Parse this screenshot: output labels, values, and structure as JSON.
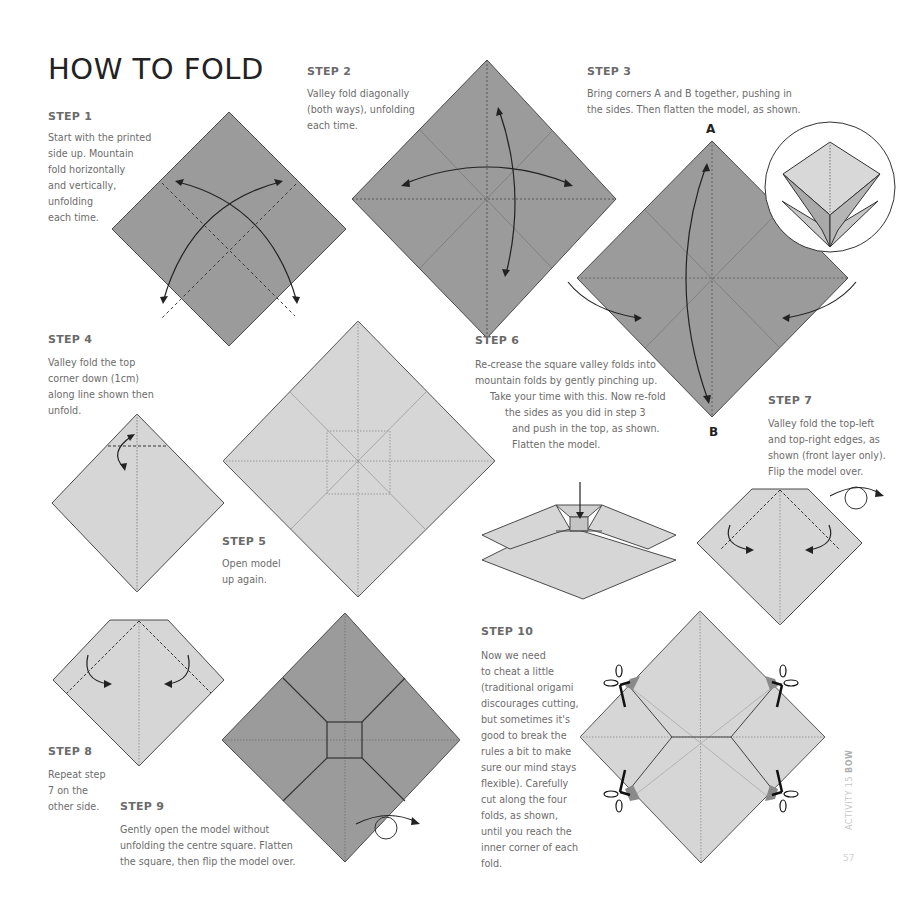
{
  "page": {
    "title": "HOW TO FOLD",
    "side_label": {
      "prefix": "ACTIVITY 15 ",
      "name": "BOW"
    },
    "page_number": "57"
  },
  "colors": {
    "dark_paper": "#9b9b9b",
    "light_paper": "#d6d6d6",
    "outline": "#4a4a4a",
    "text": "#6c6c6c",
    "heading": "#222222"
  },
  "steps": [
    {
      "heading": "STEP 1",
      "text": "Start with the printed\nside up. Mountain\nfold horizontally\nand vertically,\nunfolding\neach time."
    },
    {
      "heading": "STEP 2",
      "text": "Valley fold diagonally\n(both ways), unfolding\neach time."
    },
    {
      "heading": "STEP 3",
      "text": "Bring corners A and B together, pushing in\nthe sides. Then flatten the model, as shown."
    },
    {
      "heading": "STEP 4",
      "text": "Valley fold the top\ncorner down (1cm)\nalong line shown then\nunfold."
    },
    {
      "heading": "STEP 5",
      "text": "Open model\nup again."
    },
    {
      "heading": "STEP 6",
      "lines": [
        "Re-crease the square valley folds into",
        "mountain folds by gently pinching up.",
        "Take your time with this. Now re-fold",
        "the sides as you did in step 3",
        "and push in the top, as shown.",
        "Flatten the model."
      ]
    },
    {
      "heading": "STEP 7",
      "text": "Valley fold the top-left\nand top-right edges, as\nshown (front layer only).\nFlip the model over."
    },
    {
      "heading": "STEP 8",
      "text": "Repeat step\n7 on the\nother side."
    },
    {
      "heading": "STEP 9",
      "text": "Gently open the model without\nunfolding the centre square. Flatten\nthe square, then flip the model over."
    },
    {
      "heading": "STEP 10",
      "text": "Now we need\nto cheat a little\n(traditional origami\ndiscourages cutting,\nbut sometimes it's\ngood to break the\nrules a bit to make\nsure our mind stays\nflexible). Carefully\ncut along the four\nfolds, as shown,\nuntil you reach the\ninner corner of each\nfold."
    }
  ],
  "corner_labels": {
    "a": "A",
    "b": "B"
  },
  "icons": [
    "curved-arrow-icon",
    "flip-over-icon",
    "scissors-icon",
    "push-down-arrow-icon"
  ]
}
